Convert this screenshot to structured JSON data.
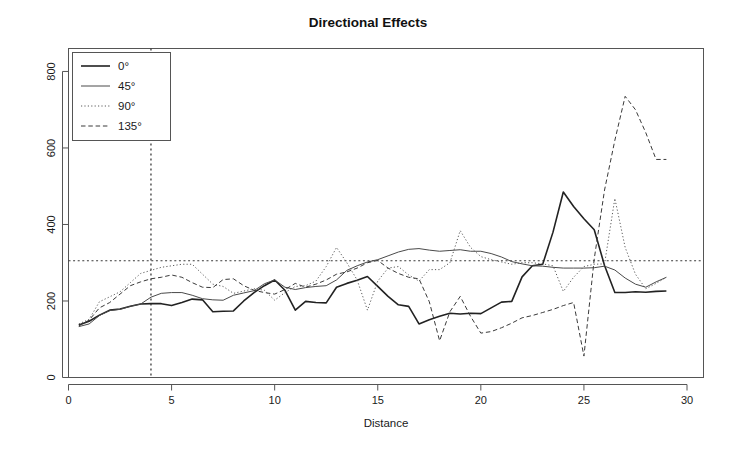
{
  "figure": {
    "background": "#ffffff",
    "frame_color": "#555555",
    "width": 736,
    "height": 456
  },
  "chart_data": {
    "type": "line",
    "title": "Directional Effects",
    "xlabel": "Distance",
    "ylabel": "",
    "xlim": [
      0,
      30.8
    ],
    "ylim": [
      0,
      860
    ],
    "xticks": [
      0,
      5,
      10,
      15,
      20,
      25,
      30
    ],
    "yticks": [
      0,
      200,
      400,
      600,
      800
    ],
    "xtick_labels": [
      "0",
      "5",
      "10",
      "15",
      "20",
      "25",
      "30"
    ],
    "ytick_labels": [
      "0",
      "200",
      "400",
      "600",
      "800"
    ],
    "grid": false,
    "legend_position": "top-left",
    "reference_lines": [
      {
        "name": "sill",
        "orientation": "horizontal",
        "value": 305,
        "style": "dotted",
        "color": "#3a3a3a"
      },
      {
        "name": "range",
        "orientation": "vertical",
        "value": 4,
        "style": "dotted",
        "color": "#2a2a2a"
      }
    ],
    "x": [
      0.5,
      1,
      1.5,
      2,
      2.5,
      3,
      3.5,
      4,
      4.5,
      5,
      5.5,
      6,
      6.5,
      7,
      7.5,
      8,
      8.5,
      9,
      9.5,
      10,
      10.5,
      11,
      11.5,
      12,
      12.5,
      13,
      13.5,
      14,
      14.5,
      15,
      15.5,
      16,
      16.5,
      17,
      17.5,
      18,
      18.5,
      19,
      19.5,
      20,
      20.5,
      21,
      21.5,
      22,
      22.5,
      23,
      23.5,
      24,
      24.5,
      25,
      25.5,
      26,
      26.5,
      27,
      27.5,
      28,
      28.5,
      29
    ],
    "series": [
      {
        "name": "0°",
        "label": "0°",
        "style": "solid",
        "width": 1.6,
        "color": "#222222",
        "values": [
          137,
          147,
          163,
          176,
          179,
          186,
          192,
          193,
          193,
          188,
          196,
          205,
          203,
          172,
          173,
          174,
          200,
          222,
          240,
          255,
          228,
          176,
          199,
          196,
          195,
          236,
          246,
          254,
          264,
          238,
          212,
          190,
          186,
          140,
          151,
          160,
          168,
          166,
          168,
          167,
          182,
          197,
          199,
          263,
          292,
          296,
          380,
          485,
          447,
          415,
          386,
          293,
          222,
          222,
          224,
          223,
          225,
          226
        ]
      },
      {
        "name": "45°",
        "label": "45°",
        "style": "solid",
        "width": 1.0,
        "color": "#4a4a4a",
        "values": [
          133,
          140,
          162,
          175,
          178,
          186,
          192,
          210,
          220,
          222,
          222,
          215,
          206,
          203,
          202,
          215,
          221,
          227,
          245,
          255,
          236,
          230,
          235,
          238,
          240,
          255,
          280,
          292,
          302,
          308,
          318,
          328,
          335,
          337,
          333,
          330,
          332,
          334,
          330,
          330,
          324,
          315,
          303,
          297,
          292,
          291,
          288,
          286,
          286,
          286,
          287,
          291,
          281,
          260,
          244,
          236,
          250,
          262
        ]
      },
      {
        "name": "90°",
        "label": "90°",
        "style": "dotted",
        "width": 1.0,
        "color": "#5a5a5a",
        "values": [
          140,
          152,
          198,
          211,
          224,
          248,
          272,
          280,
          288,
          292,
          296,
          296,
          270,
          244,
          238,
          220,
          226,
          232,
          228,
          202,
          222,
          238,
          240,
          252,
          290,
          340,
          300,
          255,
          176,
          252,
          286,
          290,
          268,
          252,
          282,
          282,
          300,
          384,
          340,
          316,
          308,
          302,
          296,
          300,
          300,
          297,
          292,
          225,
          262,
          290,
          296,
          297,
          468,
          340,
          270,
          232,
          246,
          262
        ]
      },
      {
        "name": "135°",
        "label": "135°",
        "style": "dashed",
        "width": 1.0,
        "color": "#3a3a3a",
        "values": [
          135,
          150,
          182,
          196,
          218,
          240,
          250,
          258,
          262,
          268,
          262,
          248,
          236,
          235,
          256,
          258,
          240,
          228,
          222,
          218,
          230,
          246,
          236,
          244,
          255,
          270,
          276,
          286,
          300,
          306,
          286,
          272,
          262,
          258,
          198,
          96,
          172,
          212,
          160,
          116,
          120,
          130,
          142,
          156,
          162,
          170,
          178,
          188,
          196,
          56,
          310,
          490,
          620,
          735,
          700,
          640,
          570,
          570
        ]
      }
    ]
  },
  "legend": {
    "items": [
      {
        "label": "0°",
        "style": "solid",
        "width": 1.6
      },
      {
        "label": "45°",
        "style": "solid",
        "width": 1.0
      },
      {
        "label": "90°",
        "style": "dotted",
        "width": 1.0
      },
      {
        "label": "135°",
        "style": "dashed",
        "width": 1.0
      }
    ]
  }
}
